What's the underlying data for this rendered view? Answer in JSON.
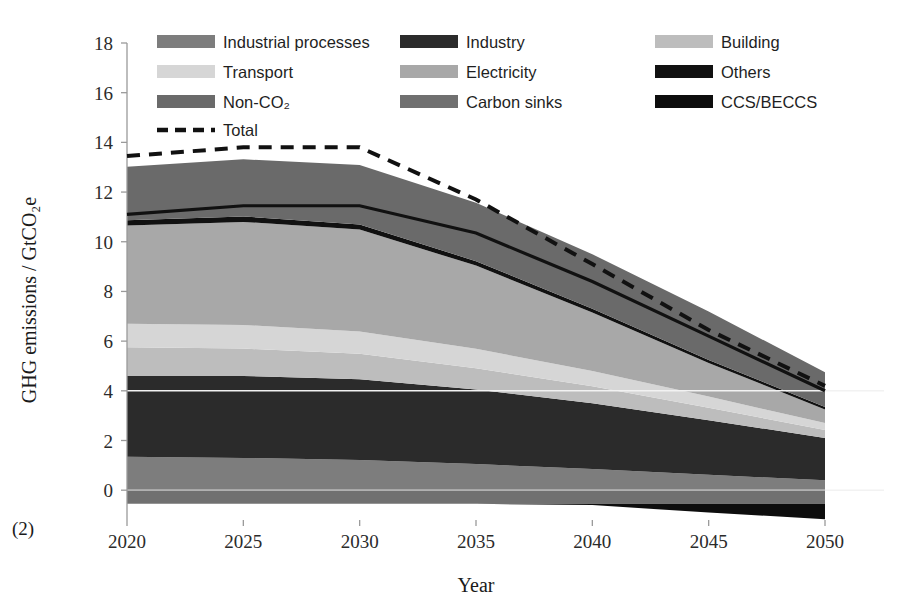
{
  "figure": {
    "panel_label": "(2)",
    "colors": {
      "industrial_processes": "#7d7d7d",
      "transport": "#d6d6d6",
      "non_co2": "#6a6a6a",
      "industry": "#2b2b2b",
      "electricity": "#a8a8a8",
      "carbon_sinks": "#707070",
      "building": "#bdbdbd",
      "others": "#111111",
      "ccs_beccs": "#0d0d0d",
      "total_line": "#111111",
      "gridline": "#f2f2f2",
      "axis": "#9a9a9a"
    }
  },
  "legend": {
    "position": "top-inside",
    "entries": [
      {
        "label": "Industrial processes",
        "key": "industrial_processes",
        "marker": "swatch"
      },
      {
        "label": "Industry",
        "key": "industry",
        "marker": "swatch"
      },
      {
        "label": "Building",
        "key": "building",
        "marker": "swatch"
      },
      {
        "label": "Transport",
        "key": "transport",
        "marker": "swatch"
      },
      {
        "label": "Electricity",
        "key": "electricity",
        "marker": "swatch"
      },
      {
        "label": "Others",
        "key": "others",
        "marker": "swatch"
      },
      {
        "label": "Non-CO₂",
        "key": "non_co2",
        "marker": "swatch"
      },
      {
        "label": "Carbon sinks",
        "key": "carbon_sinks",
        "marker": "swatch"
      },
      {
        "label": "CCS/BECCS",
        "key": "ccs_beccs",
        "marker": "swatch"
      },
      {
        "label": "Total",
        "key": "total_line",
        "marker": "dashed-line"
      }
    ]
  },
  "chart_data": {
    "type": "area",
    "stacked": true,
    "title": "",
    "xlabel": "Year",
    "ylabel": "GHG emissions  / GtCO₂e",
    "x": [
      2020,
      2025,
      2030,
      2035,
      2040,
      2045,
      2050
    ],
    "xlim": [
      2020,
      2050
    ],
    "xticks": [
      2020,
      2025,
      2030,
      2035,
      2040,
      2045,
      2050
    ],
    "xtick_labels": [
      "2020",
      "2025",
      "2030",
      "2035",
      "2040",
      "2045",
      "2050"
    ],
    "ylim": [
      -1.2,
      18
    ],
    "yticks": [
      0,
      2,
      4,
      6,
      8,
      10,
      12,
      14,
      16,
      18
    ],
    "ytick_labels": [
      "0",
      "2",
      "4",
      "6",
      "8",
      "10",
      "12",
      "14",
      "16",
      "18"
    ],
    "grid": true,
    "gridlines_at": [
      0,
      4
    ],
    "legend_position": "top-inside",
    "series": [
      {
        "name": "Industrial processes",
        "key": "industrial_processes",
        "values": [
          1.35,
          1.3,
          1.22,
          1.05,
          0.85,
          0.62,
          0.4
        ]
      },
      {
        "name": "Industry",
        "key": "industry",
        "values": [
          3.25,
          3.3,
          3.25,
          3.0,
          2.65,
          2.2,
          1.7
        ]
      },
      {
        "name": "Building",
        "key": "building",
        "values": [
          1.15,
          1.1,
          1.02,
          0.86,
          0.68,
          0.5,
          0.32
        ]
      },
      {
        "name": "Transport",
        "key": "transport",
        "values": [
          0.95,
          0.95,
          0.9,
          0.78,
          0.62,
          0.45,
          0.28
        ]
      },
      {
        "name": "Electricity",
        "key": "electricity",
        "values": [
          3.95,
          4.15,
          4.1,
          3.35,
          2.35,
          1.35,
          0.55
        ]
      },
      {
        "name": "Others",
        "key": "others",
        "values": [
          0.22,
          0.22,
          0.2,
          0.18,
          0.15,
          0.12,
          0.1
        ]
      },
      {
        "name": "Non-CO₂",
        "key": "non_co2",
        "values": [
          2.15,
          2.3,
          2.4,
          2.35,
          2.2,
          1.95,
          1.4
        ]
      },
      {
        "name": "Carbon sinks",
        "key": "carbon_sinks",
        "values": [
          -0.55,
          -0.55,
          -0.55,
          -0.55,
          -0.55,
          -0.55,
          -0.55
        ]
      },
      {
        "name": "CCS/BECCS",
        "key": "ccs_beccs",
        "values": [
          0.0,
          0.0,
          0.0,
          0.0,
          -0.05,
          -0.35,
          -0.62
        ]
      }
    ],
    "lines": [
      {
        "name": "Total",
        "key": "total_line",
        "style": "dashed",
        "values": [
          13.45,
          13.8,
          13.8,
          11.7,
          9.1,
          6.45,
          4.2
        ]
      },
      {
        "name": "Gross emissions",
        "key": "others",
        "style": "solid",
        "values": [
          11.1,
          11.45,
          11.45,
          10.35,
          8.4,
          6.2,
          4.0
        ]
      }
    ]
  }
}
